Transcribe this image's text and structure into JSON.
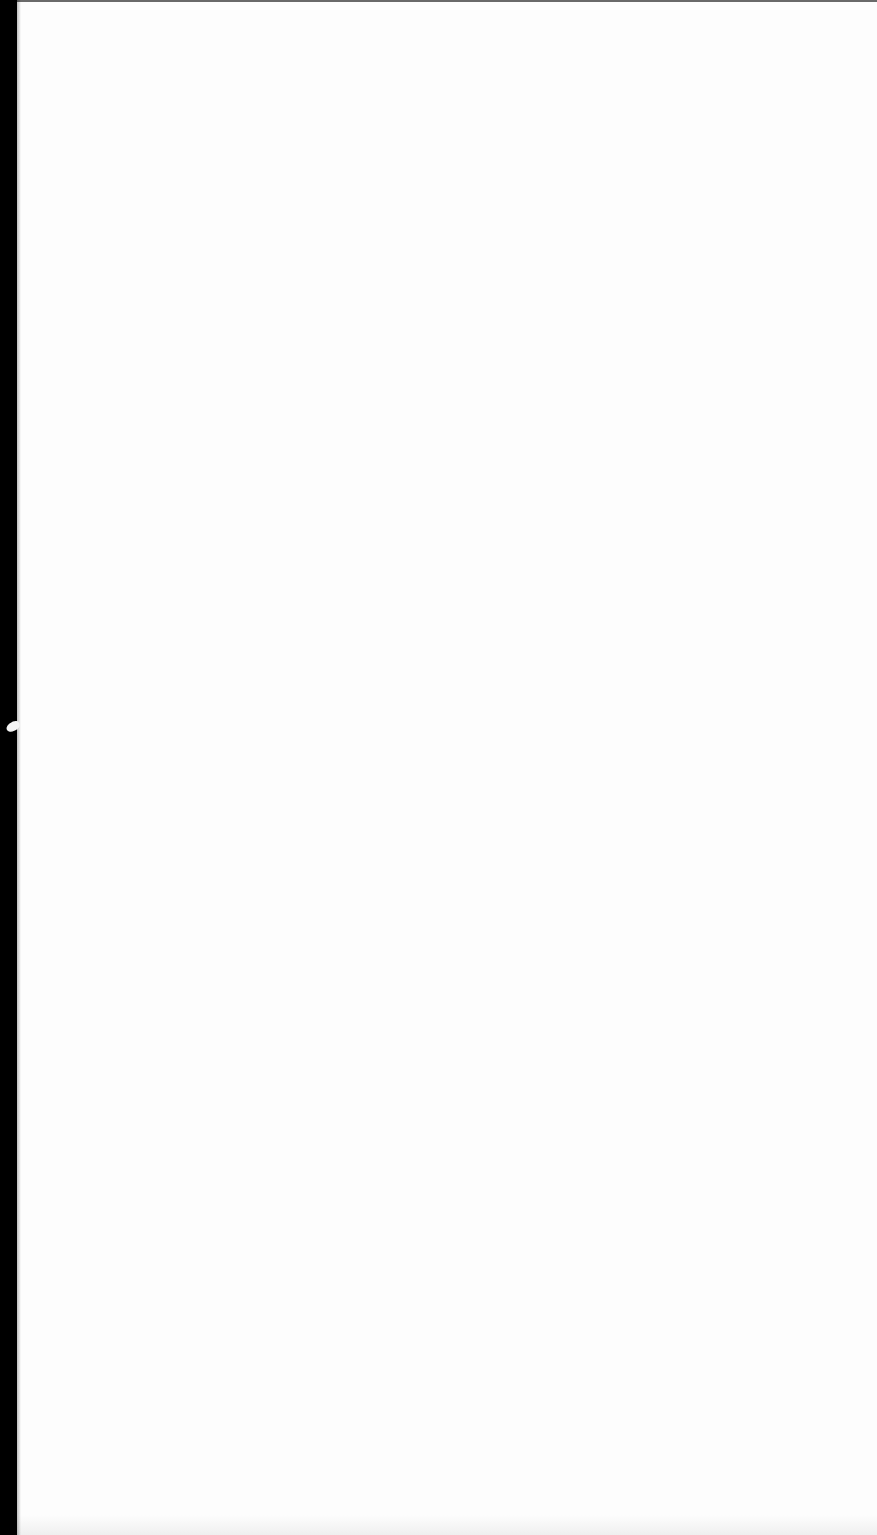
{
  "document": {
    "type": "scanned-page",
    "content": "",
    "colors": {
      "paper": "#fdfdfd",
      "scanner_bed": "#000000",
      "top_edge": "#6a6a6a"
    }
  }
}
